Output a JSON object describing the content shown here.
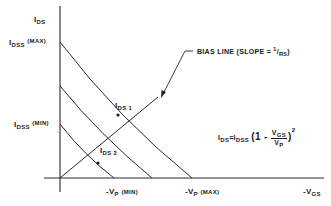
{
  "diagram": {
    "type": "JFET transfer characteristic with bias line",
    "y_axis_label": {
      "main": "I",
      "sub": "DS"
    },
    "x_axis_label": {
      "prefix": "-V",
      "sub": "GS"
    },
    "idss_max_label": {
      "main": "I",
      "sub": "DSS",
      "tag": "(MAX)"
    },
    "idss_min_label": {
      "main": "I",
      "sub": "DSS",
      "tag": "(MIN)"
    },
    "vp_min_label": {
      "prefix": "-V",
      "sub": "P",
      "tag": "(MIN)"
    },
    "vp_max_label": {
      "prefix": "-V",
      "sub": "P",
      "tag": "(MAX)"
    },
    "ids1_label": {
      "main": "I",
      "sub": "DS 1"
    },
    "ids2_label": {
      "main": "I",
      "sub": "DS 2"
    },
    "bias_line_label": {
      "text": "BIAS LINE (SLOPE = ",
      "num": "1",
      "den": "R",
      "den_sub": "S",
      "close": ")"
    },
    "equation": {
      "lhs": "I",
      "lhs_sub": "DS",
      "eq": "=",
      "rhs": "I",
      "rhs_sub": "DSS",
      "open": "(1 -",
      "num": "V",
      "num_sub": "GS",
      "den": "V",
      "den_sub": "P",
      "close": ")",
      "exp": "2"
    },
    "colors": {
      "line": "#2a2a2a",
      "background": "#ffffff"
    }
  }
}
